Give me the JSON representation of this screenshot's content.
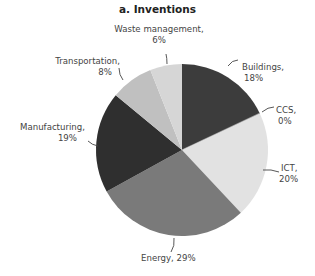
{
  "chart_data": {
    "type": "pie",
    "title": "a. Inventions",
    "categories": [
      "Buildings",
      "CCS",
      "ICT",
      "Energy",
      "Manufacturing",
      "Transportation",
      "Waste management"
    ],
    "values": [
      18,
      0,
      20,
      29,
      19,
      8,
      6
    ],
    "unit": "%",
    "colors": [
      "#3c3c3c",
      "#9a9a9a",
      "#e2e2e2",
      "#7a7a7a",
      "#2f2f2f",
      "#c0c0c0",
      "#d6d6d6"
    ],
    "start_angle_deg": 0,
    "direction": "clockwise",
    "legend": "none (direct labels)",
    "labels": [
      {
        "name": "Buildings,",
        "pct": "18%"
      },
      {
        "name": "CCS,",
        "pct": "0%"
      },
      {
        "name": "ICT,",
        "pct": "20%"
      },
      {
        "name": "Energy, 29%",
        "pct": ""
      },
      {
        "name": "Manufacturing,",
        "pct": "19%"
      },
      {
        "name": "Transportation,",
        "pct": "8%"
      },
      {
        "name": "Waste management,",
        "pct": "6%"
      }
    ]
  }
}
